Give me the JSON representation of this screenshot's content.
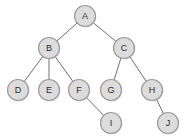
{
  "diagram": {
    "type": "tree-graph",
    "canvas": {
      "width": 183,
      "height": 139,
      "background": "#ffffff"
    },
    "style": {
      "node_fill": "#dcdcdc",
      "node_stroke": "#9a9a9a",
      "node_radius": 10.5,
      "edge_color": "#6f6f6f",
      "label_color": "#2b2b2b"
    },
    "nodes": [
      {
        "id": "A",
        "label": "A",
        "x": 85,
        "y": 16,
        "level": 0
      },
      {
        "id": "B",
        "label": "B",
        "x": 49,
        "y": 48,
        "level": 1
      },
      {
        "id": "C",
        "label": "C",
        "x": 124,
        "y": 48,
        "level": 1
      },
      {
        "id": "D",
        "label": "D",
        "x": 18,
        "y": 90,
        "level": 2
      },
      {
        "id": "E",
        "label": "E",
        "x": 49,
        "y": 90,
        "level": 2
      },
      {
        "id": "F",
        "label": "F",
        "x": 79,
        "y": 90,
        "level": 2
      },
      {
        "id": "G",
        "label": "G",
        "x": 111,
        "y": 90,
        "level": 2
      },
      {
        "id": "H",
        "label": "H",
        "x": 152,
        "y": 90,
        "level": 2
      },
      {
        "id": "I",
        "label": "I",
        "x": 111,
        "y": 123,
        "level": 3
      },
      {
        "id": "J",
        "label": "J",
        "x": 168,
        "y": 123,
        "level": 3
      }
    ],
    "edges": [
      {
        "from": "A",
        "to": "B"
      },
      {
        "from": "A",
        "to": "C"
      },
      {
        "from": "B",
        "to": "D"
      },
      {
        "from": "B",
        "to": "E"
      },
      {
        "from": "B",
        "to": "F"
      },
      {
        "from": "C",
        "to": "G"
      },
      {
        "from": "C",
        "to": "H"
      },
      {
        "from": "F",
        "to": "I"
      },
      {
        "from": "H",
        "to": "J"
      }
    ]
  }
}
